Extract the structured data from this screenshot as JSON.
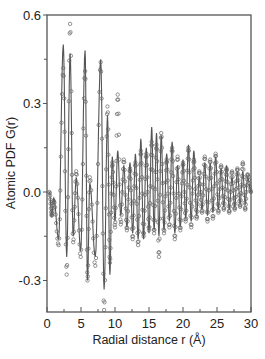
{
  "chart_data": {
    "type": "line",
    "title": "",
    "xlabel": "Radial distance r (Å)",
    "ylabel": "Atomic PDF G(r)",
    "xlim": [
      0,
      30
    ],
    "ylim": [
      -0.44,
      0.6
    ],
    "xticks": [
      0,
      5,
      10,
      15,
      20,
      25,
      30
    ],
    "xtick_labels": [
      "0",
      "5",
      "10",
      "15",
      "20",
      "25",
      "30"
    ],
    "yticks": [
      -0.3,
      0.0,
      0.3,
      0.6
    ],
    "ytick_labels": [
      "-0.3",
      "0.0",
      "0.3",
      "0.6"
    ],
    "grid": false,
    "legend": null,
    "series": [
      {
        "name": "calculated",
        "style": "solid line",
        "color": "#555555",
        "peaks_r": [
          1.0,
          2.4,
          3.4,
          4.3,
          5.6,
          6.3,
          7.9,
          8.9,
          9.6,
          10.4,
          11.3,
          12.2,
          13.0,
          13.8,
          14.6,
          15.4,
          16.1,
          16.8,
          17.6,
          18.4,
          19.2,
          20.0,
          20.8,
          21.6,
          22.4,
          23.2,
          24.0,
          24.8,
          25.6,
          26.4,
          27.2,
          28.0,
          28.8,
          29.5
        ],
        "peaks_G": [
          -0.02,
          0.5,
          0.47,
          0.05,
          0.48,
          0.03,
          0.45,
          0.26,
          0.12,
          0.14,
          0.09,
          0.1,
          0.13,
          0.18,
          0.15,
          0.22,
          0.2,
          0.19,
          0.13,
          0.17,
          0.09,
          0.11,
          0.16,
          0.14,
          0.05,
          0.1,
          0.1,
          0.12,
          0.08,
          0.09,
          0.05,
          0.07,
          0.07,
          0.05
        ],
        "troughs_G": [
          -0.16,
          -0.22,
          -0.15,
          -0.2,
          -0.3,
          -0.22,
          -0.33,
          -0.28,
          -0.1,
          -0.08,
          -0.12,
          -0.14,
          -0.16,
          -0.16,
          -0.14,
          -0.13,
          -0.15,
          -0.13,
          -0.1,
          -0.14,
          -0.12,
          -0.09,
          -0.1,
          -0.08,
          -0.06,
          -0.08,
          -0.07,
          -0.06,
          -0.05,
          -0.06,
          -0.05,
          -0.04,
          -0.04
        ]
      },
      {
        "name": "experimental",
        "style": "open circles",
        "color": "#666666",
        "peaks_r": [
          1.0,
          2.4,
          3.4,
          4.3,
          5.6,
          6.3,
          7.9,
          8.9,
          9.6,
          10.4,
          11.3,
          12.2,
          13.0,
          13.8,
          14.6,
          15.4,
          16.1,
          16.8,
          17.6,
          18.4,
          19.2,
          20.0,
          20.8,
          21.6,
          22.4,
          23.2,
          24.0,
          24.8,
          25.6,
          26.4,
          27.2,
          28.0,
          28.8,
          29.5
        ],
        "peaks_G": [
          -0.03,
          0.42,
          0.57,
          0.07,
          0.41,
          0.05,
          0.44,
          0.29,
          0.1,
          0.33,
          0.11,
          0.08,
          0.1,
          0.14,
          0.13,
          0.17,
          0.16,
          0.2,
          0.11,
          0.15,
          0.12,
          0.1,
          0.15,
          0.11,
          0.07,
          0.12,
          0.11,
          0.13,
          0.09,
          0.08,
          0.07,
          0.08,
          0.1,
          0.06
        ],
        "troughs_G": [
          -0.18,
          -0.28,
          -0.17,
          -0.22,
          -0.3,
          -0.25,
          -0.4,
          -0.24,
          -0.12,
          -0.11,
          -0.13,
          -0.16,
          -0.18,
          -0.15,
          -0.13,
          -0.14,
          -0.22,
          -0.14,
          -0.12,
          -0.16,
          -0.13,
          -0.1,
          -0.12,
          -0.09,
          -0.07,
          -0.1,
          -0.09,
          -0.07,
          -0.06,
          -0.07,
          -0.06,
          -0.05,
          -0.06
        ]
      }
    ]
  },
  "frame": {
    "color": "#555555"
  }
}
